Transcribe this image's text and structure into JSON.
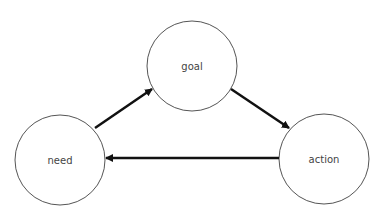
{
  "diagram": {
    "nodes": [
      {
        "id": "goal",
        "label": "goal",
        "cx": 192,
        "cy": 66,
        "r": 45
      },
      {
        "id": "need",
        "label": "need",
        "cx": 60,
        "cy": 160,
        "r": 45
      },
      {
        "id": "action",
        "label": "action",
        "cx": 324,
        "cy": 159,
        "r": 45
      }
    ],
    "edges": [
      {
        "from": "need",
        "to": "goal"
      },
      {
        "from": "goal",
        "to": "action"
      },
      {
        "from": "action",
        "to": "need"
      }
    ],
    "colors": {
      "node_stroke": "#555555",
      "edge": "#111111",
      "text": "#444444"
    }
  }
}
